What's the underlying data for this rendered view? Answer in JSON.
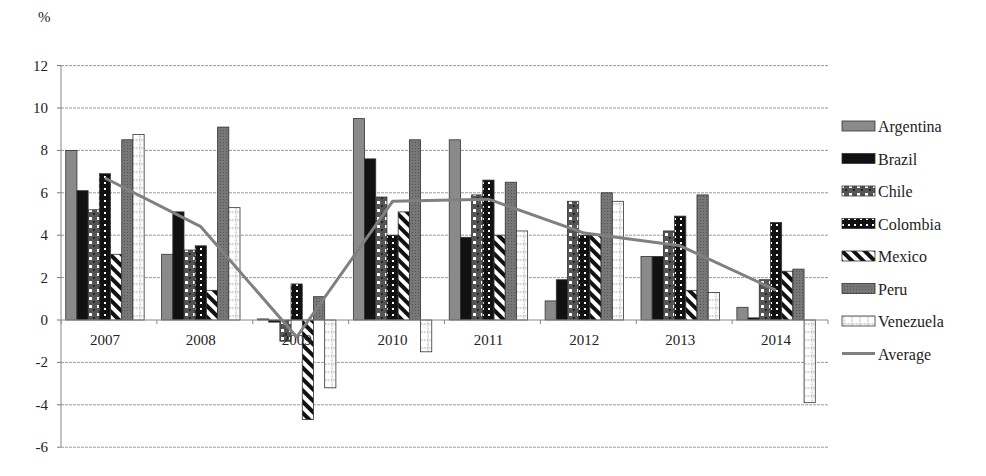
{
  "chart_data": {
    "type": "bar",
    "title": "",
    "ylabel": "%",
    "xlabel": "",
    "ylim": [
      -6,
      12
    ],
    "yticks": [
      -6,
      -4,
      -2,
      0,
      2,
      4,
      6,
      8,
      10,
      12
    ],
    "grid": true,
    "legend_position": "right",
    "categories": [
      "2007",
      "2008",
      "2009",
      "2010",
      "2011",
      "2012",
      "2013",
      "2014"
    ],
    "series": [
      {
        "name": "Argentina",
        "kind": "bar",
        "pattern": "solid-gray",
        "values": [
          8.0,
          3.1,
          0.05,
          9.5,
          8.5,
          0.9,
          3.0,
          0.6
        ]
      },
      {
        "name": "Brazil",
        "kind": "bar",
        "pattern": "solid-black",
        "values": [
          6.1,
          5.1,
          -0.1,
          7.6,
          3.9,
          1.9,
          3.0,
          0.1
        ]
      },
      {
        "name": "Chile",
        "kind": "bar",
        "pattern": "black-white-squares",
        "values": [
          5.2,
          3.3,
          -1.0,
          5.8,
          5.9,
          5.6,
          4.2,
          1.9
        ]
      },
      {
        "name": "Colombia",
        "kind": "bar",
        "pattern": "black-dots",
        "values": [
          6.9,
          3.5,
          1.7,
          4.0,
          6.6,
          4.0,
          4.9,
          4.6
        ]
      },
      {
        "name": "Mexico",
        "kind": "bar",
        "pattern": "diagonal-stripes",
        "values": [
          3.1,
          1.4,
          -4.7,
          5.1,
          4.0,
          4.0,
          1.4,
          2.3
        ]
      },
      {
        "name": "Peru",
        "kind": "bar",
        "pattern": "dark-gray-speckle",
        "values": [
          8.5,
          9.1,
          1.1,
          8.5,
          6.5,
          6.0,
          5.9,
          2.4
        ]
      },
      {
        "name": "Venezuela",
        "kind": "bar",
        "pattern": "white-grid",
        "values": [
          8.75,
          5.3,
          -3.2,
          -1.5,
          4.2,
          5.6,
          1.3,
          -3.9
        ]
      },
      {
        "name": "Average",
        "kind": "line",
        "color": "#808080",
        "values": [
          6.7,
          4.4,
          -0.8,
          5.6,
          5.7,
          4.1,
          3.5,
          1.4
        ]
      }
    ]
  },
  "labels": {
    "y_unit": "%"
  }
}
